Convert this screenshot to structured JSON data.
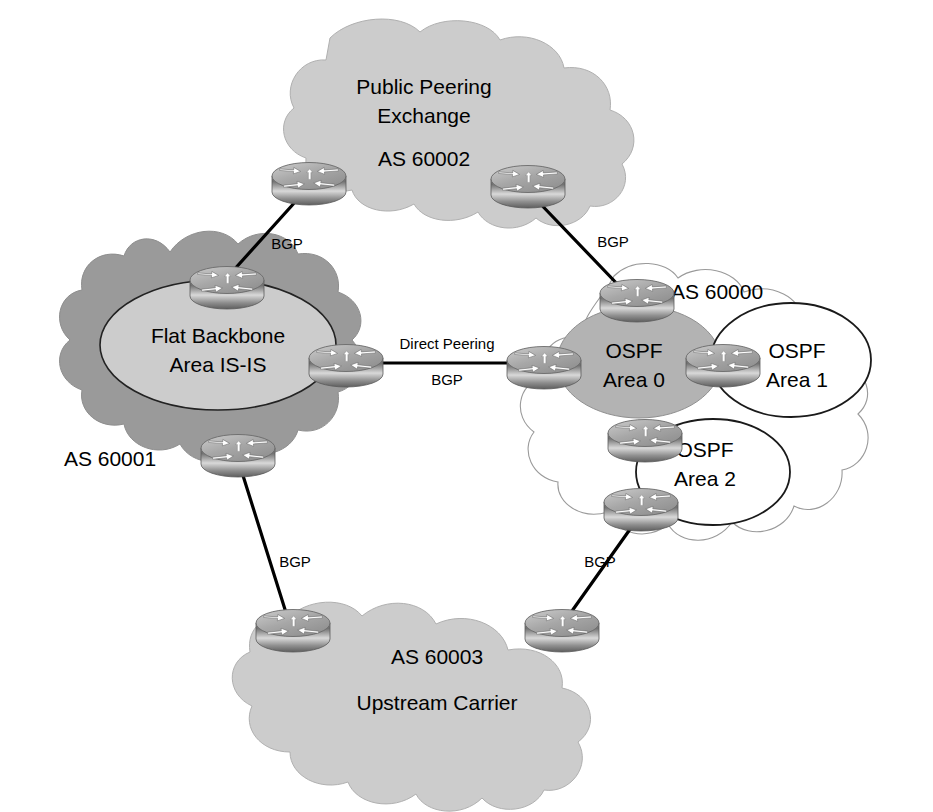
{
  "diagram": {
    "background_color": "#ffffff",
    "line_color": "#000000",
    "text_color": "#000000",
    "colors": {
      "cloud_light_gray": "#cccccc",
      "cloud_mid_gray": "#b3b3b3",
      "cloud_dark_gray": "#9a9a9a",
      "cloud_white": "#ffffff",
      "cloud_outline_thin": "#888888",
      "ellipse_outline": "#000000",
      "router_body_top": "#d8d8d8",
      "router_body_bottom": "#777777",
      "router_arrow": "#ffffff"
    }
  },
  "clouds": {
    "public_peering": {
      "name": "public-peering-exchange-cloud",
      "title_line1": "Public Peering",
      "title_line2": "Exchange",
      "as_number": "AS 60002",
      "fill": "#cccccc"
    },
    "as60001": {
      "name": "as-60001-cloud",
      "as_number": "AS 60001",
      "fill": "#9a9a9a",
      "inner_ellipse": {
        "name": "flat-backbone-ellipse",
        "title_line1": "Flat Backbone",
        "title_line2": "Area IS-IS",
        "fill": "#cccccc"
      }
    },
    "as60000": {
      "name": "as-60000-cloud",
      "as_number": "AS 60000",
      "fill": "#ffffff",
      "areas": [
        {
          "name": "ospf-area-0-ellipse",
          "title_line1": "OSPF",
          "title_line2": "Area 0",
          "fill": "#b3b3b3"
        },
        {
          "name": "ospf-area-1-ellipse",
          "title_line1": "OSPF",
          "title_line2": "Area 1",
          "fill": "#ffffff"
        },
        {
          "name": "ospf-area-2-ellipse",
          "title_line1": "OSPF",
          "title_line2": "Area 2",
          "fill": "#ffffff"
        }
      ]
    },
    "as60003": {
      "name": "as-60003-cloud",
      "as_number": "AS 60003",
      "title": "Upstream Carrier",
      "fill": "#cccccc"
    }
  },
  "links": [
    {
      "name": "link-as60001-to-as60002",
      "label": "BGP",
      "from": "router-as60001-top",
      "to": "router-as60002-left"
    },
    {
      "name": "link-as60002-to-as60000",
      "label": "BGP",
      "from": "router-as60002-right",
      "to": "router-as60000-top"
    },
    {
      "name": "link-as60001-to-as60000",
      "label_line1": "Direct Peering",
      "label_line2": "BGP",
      "from": "router-as60001-right",
      "to": "router-as60000-left"
    },
    {
      "name": "link-as60001-to-as60003",
      "label": "BGP",
      "from": "router-as60001-bottom",
      "to": "router-as60003-left"
    },
    {
      "name": "link-as60000-to-as60003",
      "label": "BGP",
      "from": "router-as60000-bottom",
      "to": "router-as60003-right"
    }
  ],
  "routers": [
    {
      "name": "router-as60002-left",
      "icon": "router-icon",
      "cloud": "AS 60002"
    },
    {
      "name": "router-as60002-right",
      "icon": "router-icon",
      "cloud": "AS 60002"
    },
    {
      "name": "router-as60001-top",
      "icon": "router-icon",
      "cloud": "AS 60001"
    },
    {
      "name": "router-as60001-right",
      "icon": "router-icon",
      "cloud": "AS 60001"
    },
    {
      "name": "router-as60001-bottom",
      "icon": "router-icon",
      "cloud": "AS 60001"
    },
    {
      "name": "router-as60000-top",
      "icon": "router-icon",
      "cloud": "AS 60000"
    },
    {
      "name": "router-as60000-left",
      "icon": "router-icon",
      "cloud": "AS 60000"
    },
    {
      "name": "router-as60000-abr1",
      "icon": "router-icon",
      "cloud": "AS 60000"
    },
    {
      "name": "router-as60000-abr2",
      "icon": "router-icon",
      "cloud": "AS 60000"
    },
    {
      "name": "router-as60000-bottom",
      "icon": "router-icon",
      "cloud": "AS 60000"
    },
    {
      "name": "router-as60003-left",
      "icon": "router-icon",
      "cloud": "AS 60003"
    },
    {
      "name": "router-as60003-right",
      "icon": "router-icon",
      "cloud": "AS 60003"
    }
  ]
}
